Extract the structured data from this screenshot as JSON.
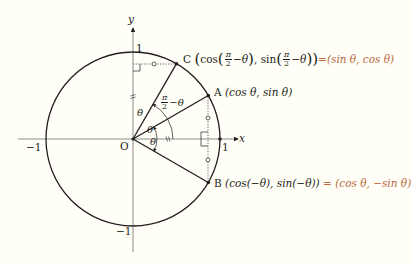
{
  "diagram": {
    "type": "unit-circle",
    "theta_deg": 30,
    "axes": {
      "x_label": "x",
      "y_label": "y"
    },
    "tick_labels": {
      "x_pos": "1",
      "x_neg": "−1",
      "y_pos": "1",
      "y_neg": "−1",
      "origin": "O"
    },
    "angle_labels": {
      "theta_a": "θ",
      "theta_b": "θ",
      "theta_y": "θ",
      "complement_num": "π",
      "complement_den": "2",
      "complement_rest": "−θ"
    },
    "points": {
      "A": {
        "name": "A",
        "coords": "(cos θ, sin θ)"
      },
      "B": {
        "name": "B",
        "coords": "(cos(−θ), sin(−θ))",
        "eq": "=",
        "result": "(cos θ, −sin θ)"
      },
      "C": {
        "name": "C",
        "open": "(cos(",
        "num": "π",
        "den": "2",
        "mid1": "−θ), sin(",
        "num2": "π",
        "den2": "2",
        "close": "−θ))",
        "eq": "=",
        "result": "(sin θ, cos θ)"
      }
    },
    "colors": {
      "line": "#231f20",
      "highlight": "#b8683c",
      "axis": "#6d6e71",
      "background": "#fffef7"
    }
  }
}
